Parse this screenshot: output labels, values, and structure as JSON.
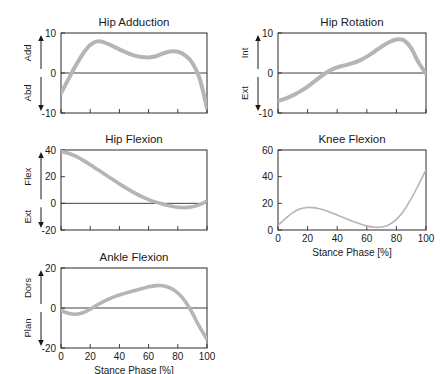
{
  "figure": {
    "background": "#ffffff",
    "curve_color": "#b5b5b5",
    "axis_color": "#2b2b2b",
    "xlabel": "Stance Phase [%]"
  },
  "chart_data": [
    {
      "id": "hip-adduction",
      "type": "line",
      "title": "Hip Adduction",
      "xlabel": "",
      "ylabel": "",
      "xlim": [
        0,
        100
      ],
      "ylim": [
        -10,
        10
      ],
      "xticks": [
        0,
        20,
        40,
        60,
        80,
        100
      ],
      "xticklabels": [
        "",
        "",
        "",
        "",
        "",
        ""
      ],
      "yticks": [
        -10,
        0,
        10
      ],
      "yticklabels": [
        "-10",
        "0",
        "10"
      ],
      "grid": false,
      "show_xticklabels": false,
      "zero_line": true,
      "band_width": 4.0,
      "direction_labels": {
        "positive": "Add",
        "negative": "Abd"
      },
      "x": [
        0,
        5,
        10,
        15,
        20,
        25,
        30,
        35,
        40,
        45,
        50,
        55,
        60,
        65,
        70,
        75,
        80,
        85,
        90,
        95,
        100
      ],
      "values": [
        -5.0,
        -1.6,
        1.8,
        4.8,
        7.0,
        7.9,
        7.6,
        6.8,
        5.9,
        5.1,
        4.4,
        4.0,
        3.9,
        4.2,
        4.9,
        5.4,
        5.3,
        4.4,
        2.5,
        -1.4,
        -8.8
      ]
    },
    {
      "id": "hip-rotation",
      "type": "line",
      "title": "Hip Rotation",
      "xlabel": "",
      "ylabel": "",
      "xlim": [
        0,
        100
      ],
      "ylim": [
        -10,
        10
      ],
      "xticks": [
        0,
        20,
        40,
        60,
        80,
        100
      ],
      "xticklabels": [
        "",
        "",
        "",
        "",
        "",
        ""
      ],
      "yticks": [
        -10,
        0,
        10
      ],
      "yticklabels": [
        "-10",
        "0",
        "10"
      ],
      "grid": false,
      "show_xticklabels": false,
      "zero_line": true,
      "band_width": 4.0,
      "direction_labels": {
        "positive": "Int",
        "negative": "Ext"
      },
      "x": [
        0,
        5,
        10,
        15,
        20,
        25,
        30,
        35,
        40,
        45,
        50,
        55,
        60,
        65,
        70,
        75,
        80,
        85,
        90,
        95,
        100
      ],
      "values": [
        -7.0,
        -6.4,
        -5.6,
        -4.6,
        -3.4,
        -2.0,
        -0.6,
        0.6,
        1.4,
        1.9,
        2.4,
        3.1,
        4.1,
        5.3,
        6.6,
        7.7,
        8.4,
        8.2,
        6.2,
        2.6,
        -0.2
      ]
    },
    {
      "id": "hip-flexion",
      "type": "line",
      "title": "Hip Flexion",
      "xlabel": "",
      "ylabel": "",
      "xlim": [
        0,
        100
      ],
      "ylim": [
        -20,
        40
      ],
      "xticks": [
        0,
        20,
        40,
        60,
        80,
        100
      ],
      "xticklabels": [
        "",
        "",
        "",
        "",
        "",
        ""
      ],
      "yticks": [
        -20,
        0,
        20,
        40
      ],
      "yticklabels": [
        "-20",
        "0",
        "20",
        "40"
      ],
      "grid": false,
      "show_xticklabels": false,
      "zero_line": true,
      "band_width": 3.6,
      "direction_labels": {
        "positive": "Flex",
        "negative": "Ext"
      },
      "x": [
        0,
        5,
        10,
        15,
        20,
        25,
        30,
        35,
        40,
        45,
        50,
        55,
        60,
        65,
        70,
        75,
        80,
        85,
        90,
        95,
        100
      ],
      "values": [
        38.8,
        37.6,
        35.4,
        32.4,
        29.0,
        25.4,
        21.8,
        18.2,
        14.6,
        11.2,
        8.0,
        5.2,
        2.8,
        0.9,
        -0.7,
        -2.0,
        -2.9,
        -3.2,
        -2.6,
        -1.0,
        1.6
      ]
    },
    {
      "id": "knee-flexion",
      "type": "line",
      "title": "Knee Flexion",
      "xlabel": "Stance Phase [%]",
      "ylabel": "",
      "xlim": [
        0,
        100
      ],
      "ylim": [
        0,
        60
      ],
      "xticks": [
        0,
        20,
        40,
        60,
        80,
        100
      ],
      "xticklabels": [
        "0",
        "20",
        "40",
        "60",
        "80",
        "100"
      ],
      "yticks": [
        0,
        20,
        40,
        60
      ],
      "yticklabels": [
        "0",
        "20",
        "40",
        "60"
      ],
      "grid": false,
      "show_xticklabels": true,
      "zero_line": false,
      "band_width": 1.6,
      "direction_labels": null,
      "x": [
        0,
        5,
        10,
        15,
        20,
        25,
        30,
        35,
        40,
        45,
        50,
        55,
        60,
        65,
        70,
        75,
        80,
        85,
        90,
        95,
        100
      ],
      "values": [
        3.5,
        8.5,
        13.0,
        15.9,
        16.9,
        16.6,
        15.3,
        13.4,
        11.2,
        9.0,
        6.8,
        4.8,
        3.1,
        2.1,
        2.2,
        4.0,
        8.0,
        14.5,
        23.5,
        34.0,
        45.0
      ]
    },
    {
      "id": "ankle-flexion",
      "type": "line",
      "title": "Ankle Flexion",
      "xlabel": "Stance Phase [%]",
      "ylabel": "",
      "xlim": [
        0,
        100
      ],
      "ylim": [
        -20,
        20
      ],
      "xticks": [
        0,
        20,
        40,
        60,
        80,
        100
      ],
      "xticklabels": [
        "0",
        "20",
        "40",
        "60",
        "80",
        "100"
      ],
      "yticks": [
        -20,
        0,
        20
      ],
      "yticklabels": [
        "-20",
        "0",
        "20"
      ],
      "grid": false,
      "show_xticklabels": true,
      "zero_line": true,
      "band_width": 3.6,
      "direction_labels": {
        "positive": "Dors",
        "negative": "Plan"
      },
      "x": [
        0,
        5,
        10,
        15,
        20,
        25,
        30,
        35,
        40,
        45,
        50,
        55,
        60,
        65,
        70,
        75,
        80,
        85,
        90,
        95,
        100
      ],
      "values": [
        -1.2,
        -2.6,
        -3.1,
        -2.4,
        -0.6,
        1.6,
        3.6,
        5.2,
        6.5,
        7.6,
        8.6,
        9.6,
        10.6,
        11.2,
        11.1,
        9.9,
        7.5,
        3.4,
        -2.6,
        -9.6,
        -15.6
      ]
    }
  ],
  "panel_layout": [
    {
      "id": "hip-adduction",
      "left": 6,
      "top": 12,
      "width": 208,
      "height": 118,
      "plot_left": 55,
      "plot_top": 21,
      "plot_width": 146,
      "plot_height": 80
    },
    {
      "id": "hip-rotation",
      "left": 222,
      "top": 12,
      "width": 212,
      "height": 118,
      "plot_left": 56,
      "plot_top": 21,
      "plot_width": 148,
      "plot_height": 80
    },
    {
      "id": "hip-flexion",
      "left": 6,
      "top": 130,
      "width": 208,
      "height": 112,
      "plot_left": 55,
      "plot_top": 20,
      "plot_width": 146,
      "plot_height": 80
    },
    {
      "id": "knee-flexion",
      "left": 222,
      "top": 130,
      "width": 212,
      "height": 124,
      "plot_left": 56,
      "plot_top": 20,
      "plot_width": 148,
      "plot_height": 80
    },
    {
      "id": "ankle-flexion",
      "left": 6,
      "top": 248,
      "width": 208,
      "height": 124,
      "plot_left": 55,
      "plot_top": 20,
      "plot_width": 146,
      "plot_height": 80
    }
  ]
}
